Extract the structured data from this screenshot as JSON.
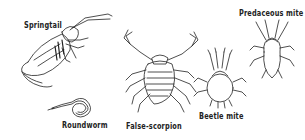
{
  "figure": {
    "labels": {
      "springtail": "Springtail",
      "roundworm": "Roundworm",
      "false_scorpion": "False-scorpion",
      "beetle_mite": "Beetle mite",
      "predaceous_mite": "Predaceous mite"
    },
    "colors": {
      "ink": "#222222",
      "background": "#ffffff"
    }
  }
}
